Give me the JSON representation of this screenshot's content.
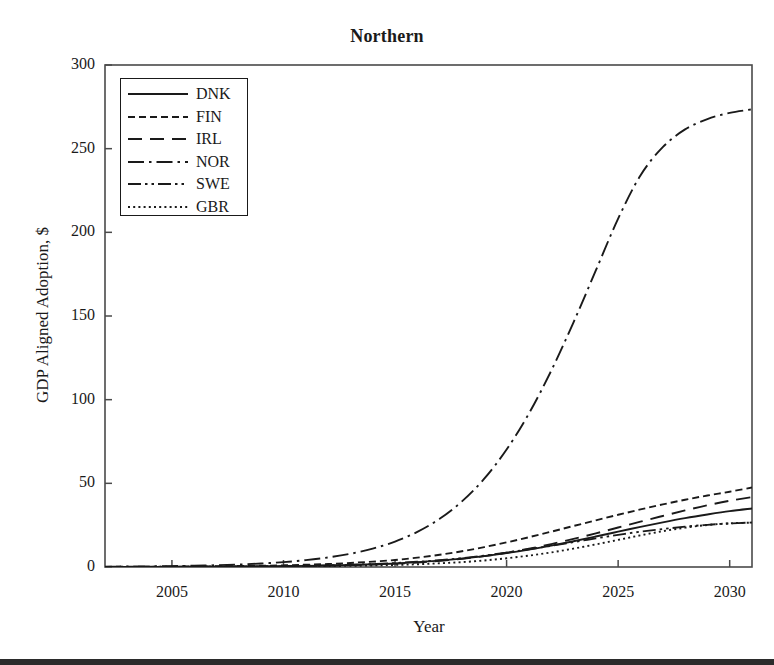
{
  "chart_data": {
    "type": "line",
    "title": "Northern",
    "xlabel": "Year",
    "ylabel": "GDP Aligned Adoption, $",
    "xlim": [
      2002,
      2031
    ],
    "ylim": [
      0,
      300
    ],
    "xticks": [
      2005,
      2010,
      2015,
      2020,
      2025,
      2030
    ],
    "yticks": [
      0,
      50,
      100,
      150,
      200,
      250,
      300
    ],
    "grid": false,
    "legend_position": "upper left",
    "x": [
      2002,
      2003,
      2004,
      2005,
      2006,
      2007,
      2008,
      2009,
      2010,
      2011,
      2012,
      2013,
      2014,
      2015,
      2016,
      2017,
      2018,
      2019,
      2020,
      2021,
      2022,
      2023,
      2024,
      2025,
      2026,
      2027,
      2028,
      2029,
      2030,
      2031
    ],
    "series": [
      {
        "name": "DNK",
        "style": "solid",
        "values": [
          0.05,
          0.07,
          0.09,
          0.12,
          0.16,
          0.21,
          0.28,
          0.38,
          0.5,
          0.67,
          0.9,
          1.2,
          1.6,
          2.1,
          2.9,
          3.8,
          5.0,
          6.5,
          8.3,
          10.4,
          12.8,
          15.4,
          18.2,
          21.1,
          24.0,
          26.7,
          29.2,
          31.4,
          33.4,
          35.0
        ]
      },
      {
        "name": "FIN",
        "style": "short-dash",
        "values": [
          0.1,
          0.13,
          0.18,
          0.24,
          0.32,
          0.43,
          0.57,
          0.76,
          1.0,
          1.35,
          1.8,
          2.4,
          3.2,
          4.2,
          5.6,
          7.3,
          9.4,
          11.9,
          14.7,
          17.8,
          21.1,
          24.5,
          27.9,
          31.2,
          34.4,
          37.4,
          40.2,
          42.7,
          45.0,
          47.5
        ]
      },
      {
        "name": "IRL",
        "style": "long-dash",
        "values": [
          0.04,
          0.05,
          0.07,
          0.1,
          0.13,
          0.18,
          0.24,
          0.33,
          0.44,
          0.6,
          0.81,
          1.1,
          1.5,
          2.0,
          2.7,
          3.7,
          4.9,
          6.5,
          8.5,
          10.9,
          13.7,
          16.8,
          20.1,
          23.6,
          27.1,
          30.5,
          33.8,
          36.9,
          39.6,
          41.8
        ]
      },
      {
        "name": "NOR",
        "style": "dash-dot",
        "values": [
          0.2,
          0.28,
          0.39,
          0.55,
          0.77,
          1.08,
          1.5,
          2.1,
          2.9,
          4.1,
          5.7,
          7.9,
          11.0,
          15.2,
          21.0,
          28.8,
          39.2,
          52.8,
          70.2,
          91.7,
          117.3,
          146.2,
          177.2,
          208.2,
          234.0,
          250.9,
          261.5,
          267.7,
          271.4,
          273.5
        ]
      },
      {
        "name": "SWE",
        "style": "dash-dot-dot",
        "values": [
          0.06,
          0.08,
          0.1,
          0.14,
          0.18,
          0.24,
          0.32,
          0.43,
          0.57,
          0.76,
          1.0,
          1.34,
          1.78,
          2.36,
          3.1,
          4.1,
          5.3,
          6.8,
          8.6,
          10.6,
          12.7,
          14.9,
          17.1,
          19.2,
          21.1,
          22.7,
          24.1,
          25.2,
          26.0,
          26.6
        ]
      },
      {
        "name": "GBR",
        "style": "dotted",
        "values": [
          0.03,
          0.04,
          0.05,
          0.07,
          0.09,
          0.12,
          0.16,
          0.22,
          0.29,
          0.39,
          0.52,
          0.7,
          0.93,
          1.24,
          1.65,
          2.2,
          2.9,
          3.9,
          5.2,
          6.8,
          8.7,
          11.0,
          13.5,
          16.2,
          18.9,
          21.4,
          23.5,
          25.1,
          26.1,
          26.5
        ]
      }
    ],
    "legend_entries": [
      {
        "label": "DNK",
        "style": "solid"
      },
      {
        "label": "FIN",
        "style": "short-dash"
      },
      {
        "label": "IRL",
        "style": "long-dash"
      },
      {
        "label": "NOR",
        "style": "dash-dot"
      },
      {
        "label": "SWE",
        "style": "dash-dot-dot"
      },
      {
        "label": "GBR",
        "style": "dotted"
      }
    ],
    "line_color": "#1a1a1a",
    "axis_color": "#4a4a4a",
    "background": "#ffffff"
  }
}
